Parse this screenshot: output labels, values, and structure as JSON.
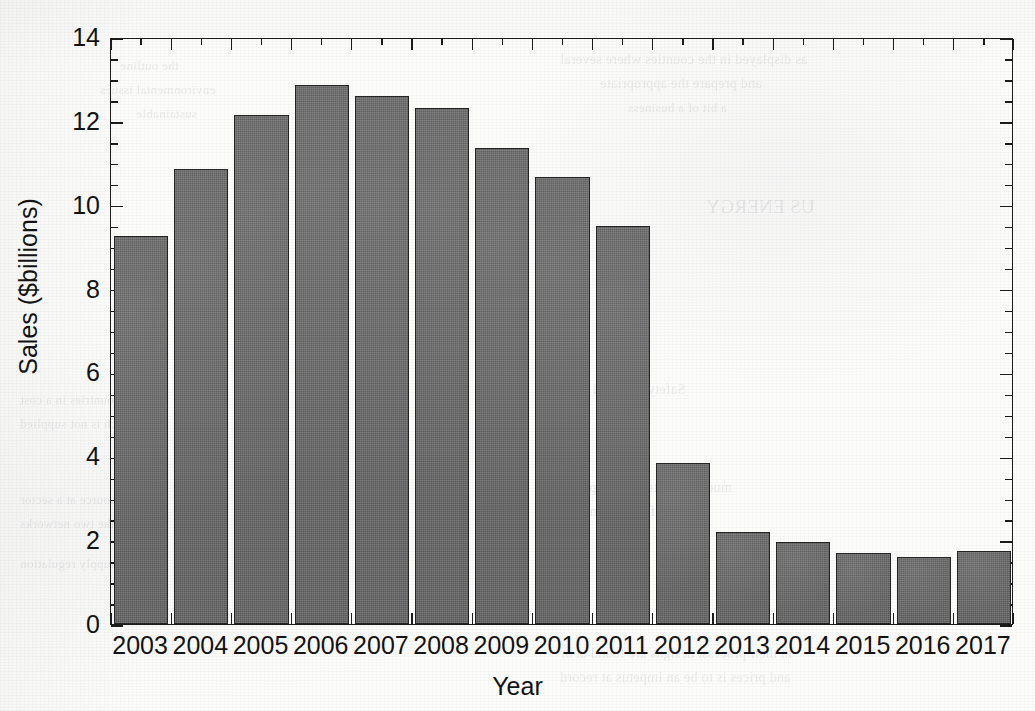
{
  "figure": {
    "background_color": "#fdfdfc",
    "axis_color": "#1c1c1c",
    "bar_color": "#6e6e6e",
    "bar_edge_color": "#242424"
  },
  "chart_data": {
    "type": "bar",
    "title": "",
    "xlabel": "Year",
    "ylabel": "Sales ($billions)",
    "categories": [
      "2003",
      "2004",
      "2005",
      "2006",
      "2007",
      "2008",
      "2009",
      "2010",
      "2011",
      "2012",
      "2013",
      "2014",
      "2015",
      "2016",
      "2017"
    ],
    "values": [
      9.25,
      10.85,
      12.15,
      12.85,
      12.6,
      12.3,
      11.35,
      10.65,
      9.5,
      3.85,
      2.2,
      1.95,
      1.7,
      1.6,
      1.75
    ],
    "ylim": [
      0,
      14
    ],
    "ytick_major": [
      0,
      2,
      4,
      6,
      8,
      10,
      12,
      14
    ],
    "ytick_minor_step": 0.5,
    "ytick_labels": [
      "0",
      "2",
      "4",
      "6",
      "8",
      "10",
      "12",
      "14"
    ],
    "grid": false,
    "legend": null,
    "frame": "box",
    "ticks_direction": "in-out"
  },
  "ghost_text": [
    {
      "text": "as displayed in the counties where several",
      "x": 560,
      "y": 52,
      "size": 14
    },
    {
      "text": "and prepare the appropriate",
      "x": 600,
      "y": 76,
      "size": 14
    },
    {
      "text": "a bit of a business",
      "x": 628,
      "y": 100,
      "size": 13
    },
    {
      "text": "the outline",
      "x": 120,
      "y": 58,
      "size": 13
    },
    {
      "text": "environmental issues",
      "x": 100,
      "y": 82,
      "size": 13
    },
    {
      "text": "sustainable",
      "x": 136,
      "y": 106,
      "size": 13
    },
    {
      "text": "US ENERGY",
      "x": 706,
      "y": 196,
      "size": 19
    },
    {
      "text": "Safety and total sales",
      "x": 560,
      "y": 382,
      "size": 14
    },
    {
      "text": "new",
      "x": 560,
      "y": 404,
      "size": 14
    },
    {
      "text": "to the countries in a cost",
      "x": 20,
      "y": 392,
      "size": 13
    },
    {
      "text": "which is not supplied",
      "x": 20,
      "y": 416,
      "size": 13
    },
    {
      "text": "much of related development",
      "x": 560,
      "y": 480,
      "size": 14
    },
    {
      "text": "energy from the market",
      "x": 560,
      "y": 504,
      "size": 14
    },
    {
      "text": "any resource at a sector",
      "x": 20,
      "y": 492,
      "size": 13
    },
    {
      "text": "of the two networks",
      "x": 20,
      "y": 516,
      "size": 13
    },
    {
      "text": "and supply regulation",
      "x": 20,
      "y": 556,
      "size": 13
    },
    {
      "text": "in their process, designs are found at or",
      "x": 560,
      "y": 646,
      "size": 14
    },
    {
      "text": "and prices is to be an impetus at record",
      "x": 560,
      "y": 670,
      "size": 14
    }
  ]
}
